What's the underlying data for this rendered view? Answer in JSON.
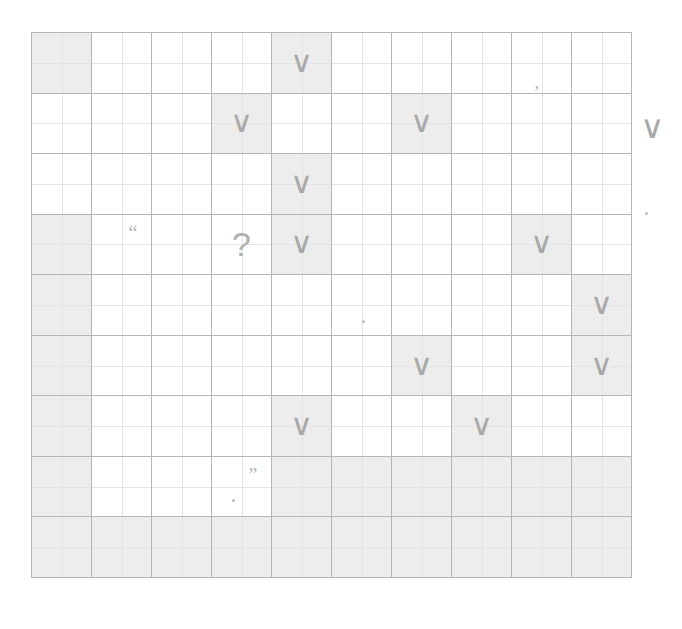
{
  "document": {
    "kind": "handwriting-practice-grid",
    "title": "Grid worksheet"
  },
  "grid": {
    "columns": 10,
    "rows": 9,
    "line_color": "#b6b6b6",
    "inner_line_color": "#e4e4e4",
    "shade_color": "#ededed",
    "glyph_color": "#a9a9a9",
    "cells": [
      [
        {
          "shaded": true,
          "glyph": ""
        },
        {
          "shaded": false,
          "glyph": ""
        },
        {
          "shaded": false,
          "glyph": ""
        },
        {
          "shaded": false,
          "glyph": ""
        },
        {
          "shaded": true,
          "glyph": "tick",
          "char": "∨"
        },
        {
          "shaded": false,
          "glyph": ""
        },
        {
          "shaded": false,
          "glyph": ""
        },
        {
          "shaded": false,
          "glyph": ""
        },
        {
          "shaded": false,
          "glyph": "comma",
          "char": ","
        },
        {
          "shaded": false,
          "glyph": ""
        }
      ],
      [
        {
          "shaded": false,
          "glyph": ""
        },
        {
          "shaded": false,
          "glyph": ""
        },
        {
          "shaded": false,
          "glyph": ""
        },
        {
          "shaded": true,
          "glyph": "tick",
          "char": "∨"
        },
        {
          "shaded": false,
          "glyph": ""
        },
        {
          "shaded": false,
          "glyph": ""
        },
        {
          "shaded": true,
          "glyph": "tick",
          "char": "∨"
        },
        {
          "shaded": false,
          "glyph": ""
        },
        {
          "shaded": false,
          "glyph": ""
        },
        {
          "shaded": false,
          "glyph": ""
        }
      ],
      [
        {
          "shaded": false,
          "glyph": ""
        },
        {
          "shaded": false,
          "glyph": ""
        },
        {
          "shaded": false,
          "glyph": ""
        },
        {
          "shaded": false,
          "glyph": ""
        },
        {
          "shaded": true,
          "glyph": "tick",
          "char": "∨"
        },
        {
          "shaded": false,
          "glyph": ""
        },
        {
          "shaded": false,
          "glyph": ""
        },
        {
          "shaded": false,
          "glyph": ""
        },
        {
          "shaded": false,
          "glyph": ""
        },
        {
          "shaded": false,
          "glyph": ""
        }
      ],
      [
        {
          "shaded": true,
          "glyph": ""
        },
        {
          "shaded": false,
          "glyph": "quote-open",
          "char": "“"
        },
        {
          "shaded": false,
          "glyph": ""
        },
        {
          "shaded": false,
          "glyph": "qmark",
          "char": "?"
        },
        {
          "shaded": true,
          "glyph": "tick",
          "char": "∨"
        },
        {
          "shaded": false,
          "glyph": ""
        },
        {
          "shaded": false,
          "glyph": ""
        },
        {
          "shaded": false,
          "glyph": ""
        },
        {
          "shaded": true,
          "glyph": "tick",
          "char": "∨"
        },
        {
          "shaded": false,
          "glyph": ""
        }
      ],
      [
        {
          "shaded": true,
          "glyph": ""
        },
        {
          "shaded": false,
          "glyph": ""
        },
        {
          "shaded": false,
          "glyph": ""
        },
        {
          "shaded": false,
          "glyph": ""
        },
        {
          "shaded": false,
          "glyph": ""
        },
        {
          "shaded": false,
          "glyph": "dot",
          "char": "·"
        },
        {
          "shaded": false,
          "glyph": ""
        },
        {
          "shaded": false,
          "glyph": ""
        },
        {
          "shaded": false,
          "glyph": ""
        },
        {
          "shaded": true,
          "glyph": "tick",
          "char": "∨"
        }
      ],
      [
        {
          "shaded": true,
          "glyph": ""
        },
        {
          "shaded": false,
          "glyph": ""
        },
        {
          "shaded": false,
          "glyph": ""
        },
        {
          "shaded": false,
          "glyph": ""
        },
        {
          "shaded": false,
          "glyph": ""
        },
        {
          "shaded": false,
          "glyph": ""
        },
        {
          "shaded": true,
          "glyph": "tick",
          "char": "∨"
        },
        {
          "shaded": false,
          "glyph": ""
        },
        {
          "shaded": false,
          "glyph": ""
        },
        {
          "shaded": true,
          "glyph": "tick",
          "char": "∨"
        }
      ],
      [
        {
          "shaded": true,
          "glyph": ""
        },
        {
          "shaded": false,
          "glyph": ""
        },
        {
          "shaded": false,
          "glyph": ""
        },
        {
          "shaded": false,
          "glyph": ""
        },
        {
          "shaded": true,
          "glyph": "tick",
          "char": "∨"
        },
        {
          "shaded": false,
          "glyph": ""
        },
        {
          "shaded": false,
          "glyph": ""
        },
        {
          "shaded": true,
          "glyph": "tick",
          "char": "∨"
        },
        {
          "shaded": false,
          "glyph": ""
        },
        {
          "shaded": false,
          "glyph": ""
        }
      ],
      [
        {
          "shaded": true,
          "glyph": ""
        },
        {
          "shaded": false,
          "glyph": ""
        },
        {
          "shaded": false,
          "glyph": ""
        },
        {
          "shaded": false,
          "glyph": "quote-close",
          "char": "”",
          "extra_dot": true
        },
        {
          "shaded": true,
          "glyph": ""
        },
        {
          "shaded": true,
          "glyph": ""
        },
        {
          "shaded": true,
          "glyph": ""
        },
        {
          "shaded": true,
          "glyph": ""
        },
        {
          "shaded": true,
          "glyph": ""
        },
        {
          "shaded": true,
          "glyph": ""
        }
      ],
      [
        {
          "shaded": true,
          "glyph": ""
        },
        {
          "shaded": true,
          "glyph": ""
        },
        {
          "shaded": true,
          "glyph": ""
        },
        {
          "shaded": true,
          "glyph": ""
        },
        {
          "shaded": true,
          "glyph": ""
        },
        {
          "shaded": true,
          "glyph": ""
        },
        {
          "shaded": true,
          "glyph": ""
        },
        {
          "shaded": true,
          "glyph": ""
        },
        {
          "shaded": true,
          "glyph": ""
        },
        {
          "shaded": true,
          "glyph": ""
        }
      ]
    ]
  },
  "margin_marks": {
    "tick": "∨",
    "dot": "·"
  }
}
